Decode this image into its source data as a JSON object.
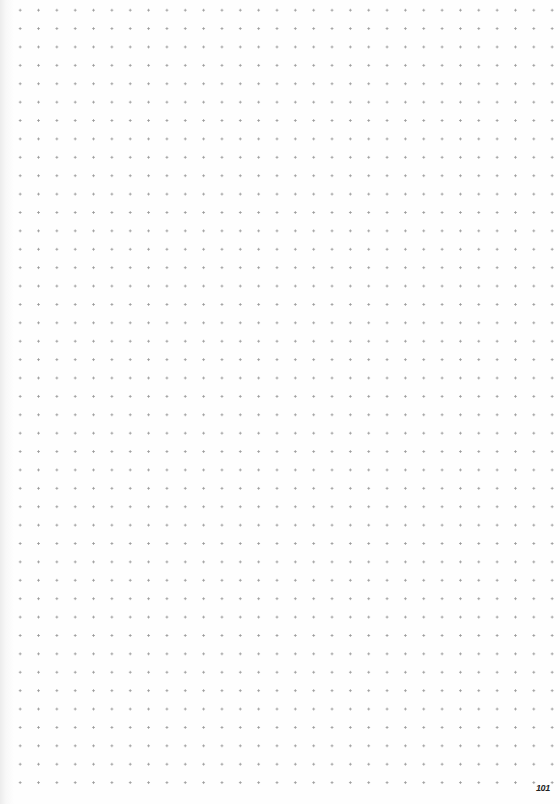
{
  "page": {
    "type": "dot-grid notebook page",
    "page_number": "101",
    "dot_color": "#9a9a9a",
    "background_color": "#fdfdfd"
  }
}
